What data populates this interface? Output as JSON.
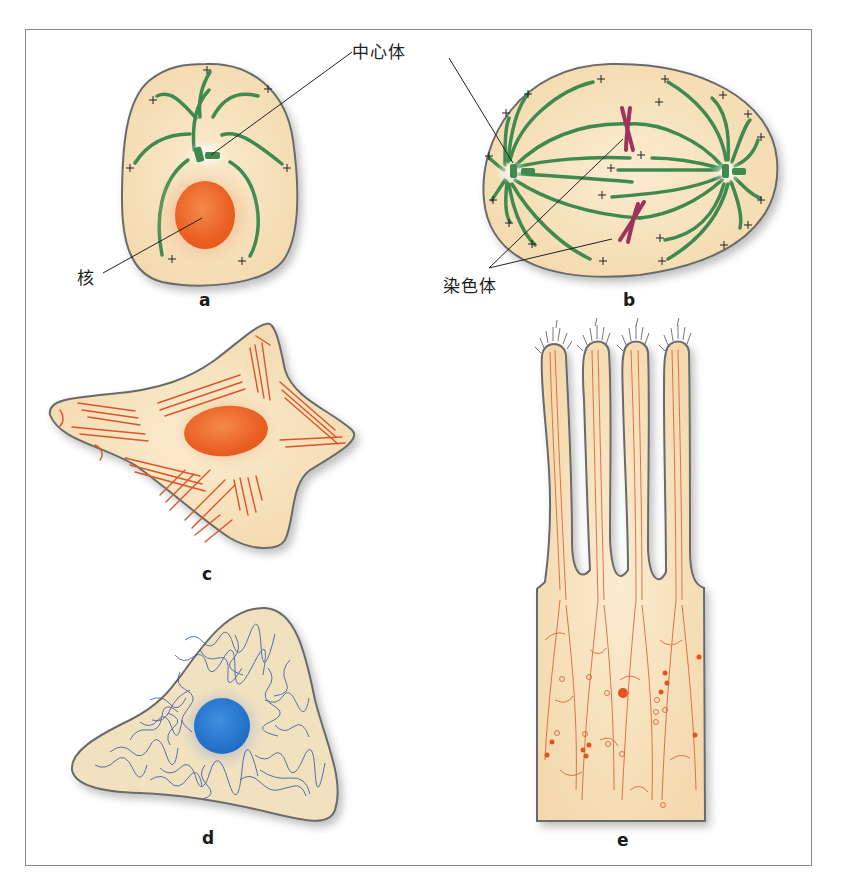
{
  "figure": {
    "panels": [
      {
        "id": "a",
        "label": "a",
        "description": "Cell with centrosome, microtubules radiating, nucleus"
      },
      {
        "id": "b",
        "label": "b",
        "description": "Mitotic spindle with two centrosomes and chromosomes"
      },
      {
        "id": "c",
        "label": "c",
        "description": "Flattened cell with actin stress fibers and nucleus"
      },
      {
        "id": "d",
        "label": "d",
        "description": "Cell with intermediate filament network around blue nucleus"
      },
      {
        "id": "e",
        "label": "e",
        "description": "Epithelial cell with microvilli containing actin bundles"
      }
    ],
    "callouts": {
      "centrosome": "中心体",
      "nucleus": "核",
      "chromosome": "染色体"
    },
    "colors": {
      "cytoplasm": "#f6dfb8",
      "outline": "#6b6b6b",
      "microtubule": "#3e8a4f",
      "nucleus_orange": "#ee6a2c",
      "actin": "#d9562a",
      "chromosome": "#a0335e",
      "intermediate_filament": "#3c5aa8",
      "nucleus_blue": "#2f7fd4"
    }
  }
}
